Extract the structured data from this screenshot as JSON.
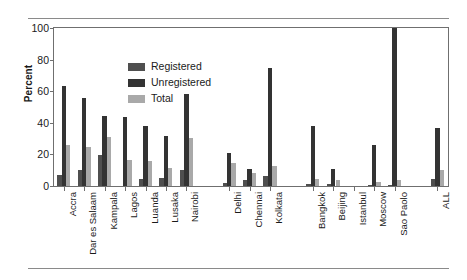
{
  "chart_data": {
    "type": "bar",
    "title": "",
    "subtitle": "",
    "xlabel": "",
    "ylabel": "Percent",
    "ylim": [
      0,
      100
    ],
    "yticks": [
      0,
      20,
      40,
      60,
      80,
      100
    ],
    "grid": false,
    "legend_position": "top-left",
    "orientation": "vertical",
    "grouped": true,
    "categories": [
      "Accra",
      "Dar es Salaam",
      "Kampala",
      "Lagos",
      "Luanda",
      "Lusaka",
      "Nairobi",
      "Delhi",
      "Chennai",
      "Kolkata",
      "Bangkok",
      "Beijing",
      "Istanbul",
      "Moscow",
      "Sao Paolo",
      "ALL"
    ],
    "series": [
      {
        "name": "Registered",
        "color": "#4f4f4f",
        "values": [
          7,
          10,
          19.5,
          0,
          4.5,
          5,
          10,
          2,
          3.5,
          6.5,
          1,
          1,
          0,
          0.5,
          0.5,
          4.5
        ]
      },
      {
        "name": "Unregistered",
        "color": "#333333",
        "values": [
          63,
          56,
          44,
          43.5,
          38,
          31.5,
          58.5,
          21,
          11,
          74.5,
          38,
          10.5,
          0,
          26,
          100,
          37
        ]
      },
      {
        "name": "Total",
        "color": "#a9a9a9",
        "values": [
          26,
          25,
          31,
          16.5,
          16,
          11.5,
          30.5,
          14.5,
          8,
          12.5,
          4.5,
          3.5,
          0,
          2.5,
          3.5,
          10
        ]
      }
    ]
  },
  "legend": {
    "entries": [
      {
        "label": "Registered",
        "swatch": "legend-swatch-registered"
      },
      {
        "label": "Unregistered",
        "swatch": "legend-swatch-unregistered"
      },
      {
        "label": "Total",
        "swatch": "legend-swatch-total"
      }
    ]
  },
  "axes": {
    "y_title": "Percent",
    "y_tick_labels": [
      "100",
      "80",
      "60",
      "40",
      "20",
      "0"
    ]
  },
  "group_breaks": [
    7,
    10,
    15
  ]
}
